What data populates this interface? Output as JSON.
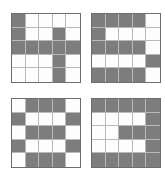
{
  "figure": {
    "title": "",
    "background_color": "#ffffff",
    "filled_color": "#7d7d7d",
    "empty_color": "#fdfdfd",
    "gridline_color": "#b9b9b9",
    "border_color": "#6e6e6e",
    "panel_count": 4,
    "grid_rows": 5,
    "grid_cols": 5
  },
  "chart_data": {
    "type": "heatmap",
    "title": "",
    "xlabel": "",
    "ylabel": "",
    "grid": true,
    "legend": "none",
    "cell_values": {
      "filled": 1,
      "empty": 0
    },
    "panels": [
      {
        "id": "top-left",
        "position": "top-left",
        "rows": 5,
        "cols": 5,
        "matrix": [
          [
            1,
            0,
            0,
            0,
            0
          ],
          [
            1,
            0,
            0,
            1,
            0
          ],
          [
            1,
            1,
            1,
            1,
            1
          ],
          [
            0,
            0,
            0,
            1,
            0
          ],
          [
            0,
            0,
            0,
            1,
            0
          ]
        ]
      },
      {
        "id": "top-right",
        "position": "top-right",
        "rows": 5,
        "cols": 5,
        "matrix": [
          [
            1,
            1,
            1,
            1,
            0
          ],
          [
            1,
            0,
            0,
            0,
            0
          ],
          [
            1,
            1,
            1,
            1,
            0
          ],
          [
            0,
            0,
            0,
            0,
            1
          ],
          [
            1,
            1,
            1,
            1,
            0
          ]
        ]
      },
      {
        "id": "bottom-left",
        "position": "bottom-left",
        "rows": 5,
        "cols": 5,
        "matrix": [
          [
            0,
            1,
            1,
            1,
            0
          ],
          [
            1,
            0,
            0,
            0,
            1
          ],
          [
            0,
            1,
            1,
            1,
            0
          ],
          [
            1,
            0,
            0,
            0,
            1
          ],
          [
            0,
            1,
            1,
            1,
            0
          ]
        ]
      },
      {
        "id": "bottom-right",
        "position": "bottom-right",
        "rows": 5,
        "cols": 5,
        "matrix": [
          [
            1,
            1,
            1,
            1,
            1
          ],
          [
            0,
            0,
            0,
            0,
            1
          ],
          [
            0,
            0,
            1,
            1,
            1
          ],
          [
            0,
            0,
            0,
            0,
            1
          ],
          [
            1,
            1,
            1,
            1,
            1
          ]
        ]
      }
    ]
  }
}
